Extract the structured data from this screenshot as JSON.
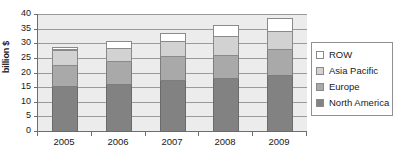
{
  "chart_data": {
    "type": "bar",
    "subtype": "stacked-bar",
    "title": "",
    "xlabel": "",
    "ylabel": "billion $",
    "categories": [
      "2005",
      "2006",
      "2007",
      "2008",
      "2009"
    ],
    "ylim": [
      0,
      40
    ],
    "ytick_labels": [
      "40",
      "35",
      "30",
      "25",
      "20",
      "15",
      "10",
      "5",
      "0"
    ],
    "ytick_values": [
      40,
      35,
      30,
      25,
      20,
      15,
      10,
      5,
      0
    ],
    "ystep": 5,
    "grid": true,
    "legend_position": "right",
    "stack_order_bottom_to_top": [
      "North America",
      "Europe",
      "Asia Pacific",
      "ROW"
    ],
    "series": [
      {
        "name": "North America",
        "color": "#828282",
        "values": [
          15.3,
          16.3,
          17.3,
          18.1,
          19.0
        ]
      },
      {
        "name": "Europe",
        "color": "#a9a9a9",
        "values": [
          7.3,
          7.8,
          8.3,
          8.0,
          8.9
        ]
      },
      {
        "name": "Asia Pacific",
        "color": "#d2d2d2",
        "values": [
          5.2,
          4.4,
          5.1,
          6.4,
          6.5
        ]
      },
      {
        "name": "ROW",
        "color": "#ffffff",
        "values": [
          0.8,
          2.4,
          2.9,
          3.9,
          4.3
        ]
      }
    ],
    "totals": [
      28.6,
      30.9,
      33.6,
      36.4,
      38.7
    ]
  },
  "legend": {
    "items": [
      {
        "label": "ROW",
        "color": "#ffffff"
      },
      {
        "label": "Asia Pacific",
        "color": "#d2d2d2"
      },
      {
        "label": "Europe",
        "color": "#a9a9a9"
      },
      {
        "label": "North America",
        "color": "#828282"
      }
    ]
  },
  "colors": {
    "plot_background": "#ececec",
    "gridline": "#9a9a9a",
    "axis": "#6e6e6e",
    "text": "#1a1a1a"
  }
}
